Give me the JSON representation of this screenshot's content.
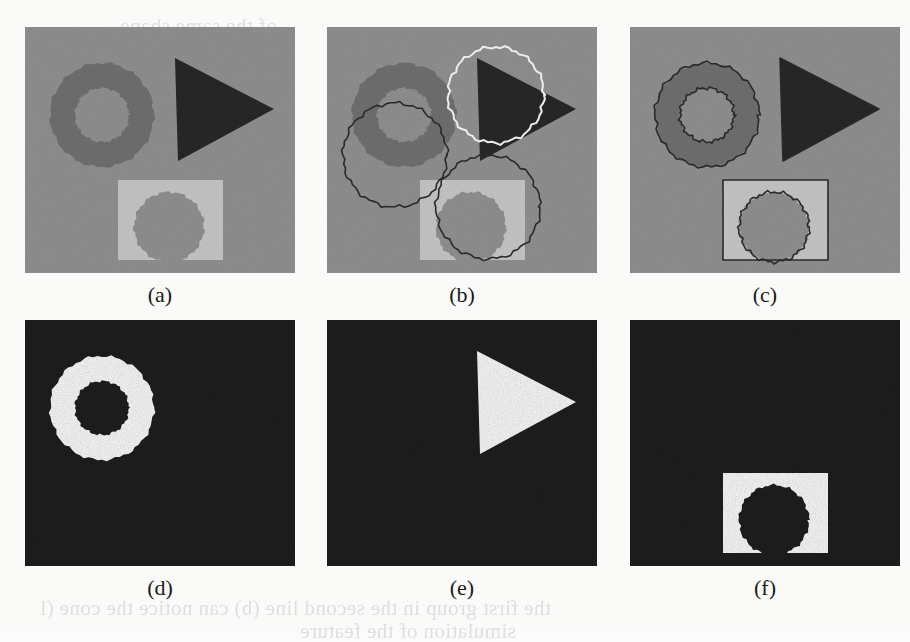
{
  "figure": {
    "rows": 2,
    "cols": 3,
    "panel_width": 270,
    "panel_height": 246,
    "captions": [
      "(a)",
      "(b)",
      "(c)",
      "(d)",
      "(e)",
      "(f)"
    ]
  },
  "colors": {
    "page_background": "#fafaf9",
    "scene_background": "#8e8e8e",
    "annulus_gray": "#6e6e6e",
    "triangle_dark": "#262626",
    "square_light": "#c3c3c3",
    "occluding_disk": "#8e8e8e",
    "contour_dark": "#2b2b2b",
    "contour_white": "#f2f2f2",
    "mask_background": "#1e1e1e",
    "mask_foreground": "#f7f7f7",
    "caption_text": "#1a1a1a",
    "bleed_through": "#c9c9c9"
  },
  "panels": [
    {
      "id": "a",
      "caption": "(a)",
      "role": "original-synthetic-image",
      "background": "#8e8e8e",
      "objects": [
        {
          "name": "annulus",
          "type": "annulus",
          "cx": 77,
          "cy": 88,
          "outer_r": 52,
          "inner_r": 27,
          "fill": "#6e6e6e"
        },
        {
          "name": "triangle",
          "type": "triangle",
          "points": "150,31 153,134 249,82",
          "fill": "#262626"
        },
        {
          "name": "square",
          "type": "rect",
          "x": 93,
          "y": 153,
          "w": 105,
          "h": 80,
          "fill": "#c3c3c3"
        },
        {
          "name": "occluding-disk",
          "type": "circle",
          "cx": 144,
          "cy": 200,
          "r": 35,
          "fill": "#8e8e8e"
        }
      ],
      "overlays": []
    },
    {
      "id": "b",
      "caption": "(b)",
      "role": "initial-contours",
      "background": "#8e8e8e",
      "objects": [
        {
          "name": "annulus",
          "type": "annulus",
          "cx": 77,
          "cy": 88,
          "outer_r": 52,
          "inner_r": 27,
          "fill": "#6e6e6e"
        },
        {
          "name": "triangle",
          "type": "triangle",
          "points": "150,31 153,134 249,82",
          "fill": "#262626"
        },
        {
          "name": "square",
          "type": "rect",
          "x": 93,
          "y": 153,
          "w": 105,
          "h": 80,
          "fill": "#c3c3c3"
        },
        {
          "name": "occluding-disk",
          "type": "circle",
          "cx": 144,
          "cy": 200,
          "r": 35,
          "fill": "#8e8e8e"
        }
      ],
      "overlays": [
        {
          "name": "initial-circle-annulus",
          "type": "circle",
          "cx": 68,
          "cy": 128,
          "r": 52,
          "stroke": "#2b2b2b",
          "stroke_width": 1.6
        },
        {
          "name": "initial-circle-triangle",
          "type": "circle",
          "cx": 169,
          "cy": 68,
          "r": 48,
          "stroke": "#f2f2f2",
          "stroke_width": 2.0
        },
        {
          "name": "initial-circle-square",
          "type": "circle",
          "cx": 161,
          "cy": 180,
          "r": 52,
          "stroke": "#2b2b2b",
          "stroke_width": 1.6
        }
      ]
    },
    {
      "id": "c",
      "caption": "(c)",
      "role": "final-converged-contours",
      "background": "#8e8e8e",
      "objects": [
        {
          "name": "annulus",
          "type": "annulus",
          "cx": 77,
          "cy": 88,
          "outer_r": 52,
          "inner_r": 27,
          "fill": "#6e6e6e"
        },
        {
          "name": "triangle",
          "type": "triangle",
          "points": "150,31 153,134 249,82",
          "fill": "#262626"
        },
        {
          "name": "square",
          "type": "rect",
          "x": 93,
          "y": 153,
          "w": 105,
          "h": 80,
          "fill": "#c3c3c3"
        },
        {
          "name": "occluding-disk",
          "type": "circle",
          "cx": 144,
          "cy": 200,
          "r": 35,
          "fill": "#8e8e8e"
        }
      ],
      "overlays": [
        {
          "name": "contour-annulus-outer",
          "type": "circle",
          "cx": 77,
          "cy": 88,
          "r": 52,
          "stroke": "#2b2b2b",
          "stroke_width": 1.6
        },
        {
          "name": "contour-annulus-inner",
          "type": "circle",
          "cx": 77,
          "cy": 88,
          "r": 27,
          "stroke": "#2b2b2b",
          "stroke_width": 1.6
        },
        {
          "name": "contour-triangle",
          "type": "triangle",
          "points": "150,31 153,134 249,82",
          "stroke": "#2b2b2b",
          "stroke_width": 1.6
        },
        {
          "name": "contour-square",
          "type": "rect",
          "x": 93,
          "y": 153,
          "w": 105,
          "h": 80,
          "stroke": "#2b2b2b",
          "stroke_width": 1.6
        },
        {
          "name": "contour-occluding-disk",
          "type": "circle",
          "cx": 144,
          "cy": 200,
          "r": 35,
          "stroke": "#2b2b2b",
          "stroke_width": 1.6
        }
      ]
    },
    {
      "id": "d",
      "caption": "(d)",
      "role": "segmentation-mask-annulus",
      "background": "#1e1e1e",
      "objects": [
        {
          "name": "mask-annulus",
          "type": "annulus",
          "cx": 77,
          "cy": 88,
          "outer_r": 52,
          "inner_r": 27,
          "fill": "#f7f7f7"
        }
      ],
      "overlays": []
    },
    {
      "id": "e",
      "caption": "(e)",
      "role": "segmentation-mask-triangle",
      "background": "#1e1e1e",
      "objects": [
        {
          "name": "mask-triangle",
          "type": "triangle",
          "points": "150,31 153,134 249,82",
          "fill": "#f7f7f7"
        }
      ],
      "overlays": []
    },
    {
      "id": "f",
      "caption": "(f)",
      "role": "segmentation-mask-square",
      "background": "#1e1e1e",
      "objects": [
        {
          "name": "mask-square",
          "type": "rect",
          "x": 93,
          "y": 153,
          "w": 105,
          "h": 80,
          "fill": "#f7f7f7"
        },
        {
          "name": "mask-occluding-disk",
          "type": "circle",
          "cx": 144,
          "cy": 200,
          "r": 35,
          "fill": "#1e1e1e"
        }
      ],
      "overlays": []
    }
  ],
  "bleed_through": [
    {
      "text": "the first group in the second line (b) can notice the cone (l",
      "x": 40,
      "y": 596
    },
    {
      "text": "simulation of the feature",
      "x": 300,
      "y": 619
    },
    {
      "text": "of the same shape",
      "x": 120,
      "y": 14
    }
  ]
}
